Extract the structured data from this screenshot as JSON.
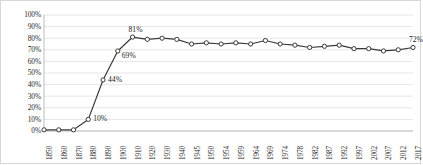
{
  "chart_data": {
    "type": "line",
    "title": "",
    "xlabel": "",
    "ylabel": "",
    "ylim": [
      0,
      100
    ],
    "ytick_labels": [
      "100%",
      "90%",
      "80%",
      "70%",
      "60%",
      "50%",
      "40%",
      "30%",
      "20%",
      "10%",
      "0%"
    ],
    "ytick_values": [
      100,
      90,
      80,
      70,
      60,
      50,
      40,
      30,
      20,
      10,
      0
    ],
    "grid": true,
    "grid_axis": "y",
    "legend": false,
    "categories": [
      "1850",
      "1860",
      "1870",
      "1880",
      "1890",
      "1900",
      "1910",
      "1920",
      "1930",
      "1940",
      "1945",
      "1950",
      "1954",
      "1959",
      "1964",
      "1969",
      "1974",
      "1978",
      "1982",
      "1987",
      "1992",
      "1997",
      "2002",
      "2007",
      "2012",
      "2017"
    ],
    "values": [
      1,
      1,
      1,
      10,
      44,
      69,
      81,
      79,
      80,
      79,
      75,
      76,
      75,
      76,
      75,
      78,
      75,
      74,
      72,
      73,
      74,
      71,
      71,
      69,
      70,
      72
    ],
    "series": [
      {
        "name": "Series 1",
        "values": [
          1,
          1,
          1,
          10,
          44,
          69,
          81,
          79,
          80,
          79,
          75,
          76,
          75,
          76,
          75,
          78,
          75,
          74,
          72,
          73,
          74,
          71,
          71,
          69,
          70,
          72
        ]
      }
    ],
    "point_labels": [
      {
        "category": "1880",
        "value": 10,
        "text": "10%"
      },
      {
        "category": "1890",
        "value": 44,
        "text": "44%"
      },
      {
        "category": "1900",
        "value": 69,
        "text": "69%"
      },
      {
        "category": "1910",
        "value": 81,
        "text": "81%"
      },
      {
        "category": "2017",
        "value": 72,
        "text": "72%"
      }
    ],
    "style": {
      "line_color": "#3a3a3a",
      "marker_fill": "#ffffff",
      "marker_edge": "#3a3a3a",
      "grid_color": "#e6e6ec",
      "axis_color": "#bdbdbd",
      "plot_background": "#ffffff",
      "frame_color": "#d8d8d8"
    }
  }
}
